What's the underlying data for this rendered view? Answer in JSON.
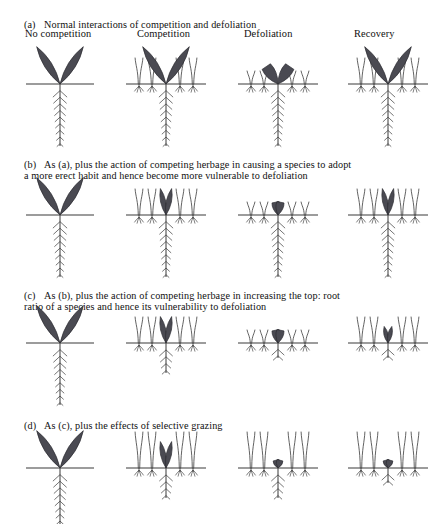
{
  "figure": {
    "title_present": false,
    "palette": {
      "leaf_fill": "#4a4a52",
      "leaf_stroke": "#2b2b30",
      "line": "#3a3a3a",
      "background": "#ffffff",
      "text": "#101010"
    }
  },
  "columns": [
    {
      "label": "No competition"
    },
    {
      "label": "Competition"
    },
    {
      "label": "Defoliation"
    },
    {
      "label": "Recovery"
    }
  ],
  "rows": [
    {
      "tag": "(a)",
      "caption": "Normal interactions of competition and defoliation",
      "panels": [
        {
          "state": "no-competition",
          "leaf_size": "large",
          "leaf_habit": "spreading",
          "root_size": "long",
          "competitors": 0,
          "competitor_height": "none"
        },
        {
          "state": "competition",
          "leaf_size": "large",
          "leaf_habit": "spreading",
          "root_size": "long",
          "competitors": 4,
          "competitor_height": "tall"
        },
        {
          "state": "defoliation",
          "leaf_size": "cut",
          "leaf_habit": "spreading",
          "root_size": "long",
          "competitors": 4,
          "competitor_height": "short"
        },
        {
          "state": "recovery",
          "leaf_size": "large",
          "leaf_habit": "spreading",
          "root_size": "long",
          "competitors": 4,
          "competitor_height": "tall"
        }
      ]
    },
    {
      "tag": "(b)",
      "caption": "As (a), plus the action of competing herbage in causing a species to adopt\na more erect habit and hence become more vulnerable to defoliation",
      "panels": [
        {
          "state": "no-competition",
          "leaf_size": "large",
          "leaf_habit": "spreading",
          "root_size": "long",
          "competitors": 0,
          "competitor_height": "none"
        },
        {
          "state": "competition",
          "leaf_size": "medium",
          "leaf_habit": "erect",
          "root_size": "long",
          "competitors": 4,
          "competitor_height": "tall"
        },
        {
          "state": "defoliation",
          "leaf_size": "stub",
          "leaf_habit": "erect",
          "root_size": "long",
          "competitors": 4,
          "competitor_height": "short"
        },
        {
          "state": "recovery",
          "leaf_size": "medium",
          "leaf_habit": "erect",
          "root_size": "long",
          "competitors": 4,
          "competitor_height": "tall"
        }
      ]
    },
    {
      "tag": "(c)",
      "caption": "As (b), plus the action of competing herbage in increasing the top: root\nratio of a species and hence its vulnerability to defoliation",
      "panels": [
        {
          "state": "no-competition",
          "leaf_size": "large",
          "leaf_habit": "spreading",
          "root_size": "long",
          "competitors": 0,
          "competitor_height": "none"
        },
        {
          "state": "competition",
          "leaf_size": "medium",
          "leaf_habit": "erect",
          "root_size": "short",
          "competitors": 4,
          "competitor_height": "tall"
        },
        {
          "state": "defoliation",
          "leaf_size": "stub",
          "leaf_habit": "erect",
          "root_size": "tiny",
          "competitors": 4,
          "competitor_height": "short"
        },
        {
          "state": "recovery",
          "leaf_size": "small",
          "leaf_habit": "erect",
          "root_size": "tiny",
          "competitors": 4,
          "competitor_height": "tall"
        }
      ]
    },
    {
      "tag": "(d)",
      "caption": "As (c), plus the effects of selective grazing",
      "panels": [
        {
          "state": "no-competition",
          "leaf_size": "large",
          "leaf_habit": "spreading",
          "root_size": "long",
          "competitors": 0,
          "competitor_height": "none"
        },
        {
          "state": "competition",
          "leaf_size": "medium",
          "leaf_habit": "erect",
          "root_size": "short",
          "competitors": 4,
          "competitor_height": "taller"
        },
        {
          "state": "defoliation",
          "leaf_size": "nub",
          "leaf_habit": "erect",
          "root_size": "short",
          "competitors": 4,
          "competitor_height": "taller"
        },
        {
          "state": "recovery",
          "leaf_size": "nub",
          "leaf_habit": "erect",
          "root_size": "tiny",
          "competitors": 4,
          "competitor_height": "taller"
        }
      ]
    }
  ]
}
